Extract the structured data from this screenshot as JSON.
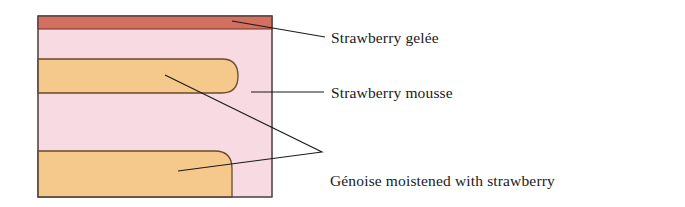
{
  "figure": {
    "type": "cross-section-illustration",
    "canvas": {
      "width": 685,
      "height": 207,
      "background": "#ffffff"
    },
    "cake_box": {
      "x": 38,
      "y": 16,
      "width": 234,
      "height": 181
    },
    "layers": [
      {
        "id": "gelee",
        "name": "Strawberry gelée",
        "fill": "#d4705f",
        "stroke": "#7a3b30",
        "x": 38,
        "y": 16,
        "width": 234,
        "height": 13
      },
      {
        "id": "mousse",
        "name": "Strawberry mousse",
        "fill": "#f7dae2",
        "stroke": "#5a4a4a",
        "x": 38,
        "y": 29,
        "width": 234,
        "height": 168
      },
      {
        "id": "genoise-top",
        "name": "Génoise moistened with strawberry simple syrup",
        "fill": "#f5c88c",
        "stroke": "#6b4a2a",
        "x": 38,
        "y": 59,
        "width": 199,
        "height": 34,
        "round_right": true
      },
      {
        "id": "genoise-bottom",
        "name": "Génoise moistened with strawberry simple syrup",
        "fill": "#f5c88c",
        "stroke": "#6b4a2a",
        "x": 38,
        "y": 151,
        "width": 194,
        "height": 46,
        "round_right": true
      }
    ],
    "leaders": [
      {
        "id": "leader-gelee",
        "points": "232,21 325,37"
      },
      {
        "id": "leader-mousse",
        "points": "251,92 324,92"
      },
      {
        "id": "leader-genoise-top",
        "points": "165,75 322,152"
      },
      {
        "id": "leader-genoise-bottom",
        "points": "178,171 322,152"
      }
    ],
    "leader_color": "#1a1a1a"
  },
  "labels": {
    "gelee": "Strawberry gelée",
    "mousse": "Strawberry mousse",
    "genoise_line1": "Génoise moistened with strawberry",
    "genoise_line2": "simple syrup"
  }
}
